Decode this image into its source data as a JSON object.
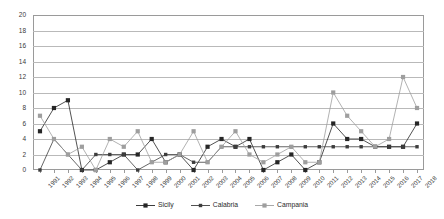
{
  "chart_data": {
    "type": "line",
    "title": "",
    "subtitle": "",
    "xlabel": "",
    "ylabel": "",
    "ylim": [
      0,
      20
    ],
    "ytick_step": 2,
    "yticks": [
      0,
      2,
      4,
      6,
      8,
      10,
      12,
      14,
      16,
      18,
      20
    ],
    "grid": true,
    "legend_position": "bottom",
    "categories": [
      "1991",
      "1992",
      "1993",
      "1994",
      "1995",
      "1996",
      "1997",
      "1998",
      "1999",
      "2000",
      "2001",
      "2002",
      "2003",
      "2004",
      "2005",
      "2006",
      "2007",
      "2008",
      "2009",
      "2010",
      "2011",
      "2012",
      "2013",
      "2014",
      "2015",
      "2016",
      "2017",
      "2018"
    ],
    "series": [
      {
        "name": "Sicily",
        "color": "#262626",
        "marker": "square",
        "values": [
          5,
          8,
          9,
          0,
          0,
          1,
          2,
          2,
          4,
          1,
          2,
          0,
          3,
          4,
          3,
          4,
          0,
          1,
          2,
          0,
          1,
          6,
          4,
          4,
          3,
          3,
          3,
          6
        ]
      },
      {
        "name": "Calabria",
        "color": "#3d3d3d",
        "marker": "small-square",
        "values": [
          0,
          4,
          2,
          0,
          2,
          2,
          2,
          0,
          1,
          2,
          2,
          1,
          1,
          3,
          3,
          3,
          3,
          3,
          3,
          3,
          3,
          3,
          3,
          3,
          3,
          3,
          3,
          3
        ]
      },
      {
        "name": "Campania",
        "color": "#9e9e9e",
        "marker": "square",
        "values": [
          7,
          4,
          2,
          3,
          0,
          4,
          3,
          5,
          1,
          1,
          2,
          5,
          1,
          3,
          5,
          2,
          1,
          2,
          3,
          1,
          1,
          10,
          7,
          5,
          3,
          4,
          12,
          8
        ]
      }
    ]
  },
  "legend": {
    "items": [
      {
        "label": "Sicily"
      },
      {
        "label": "Calabria"
      },
      {
        "label": "Campania"
      }
    ]
  }
}
